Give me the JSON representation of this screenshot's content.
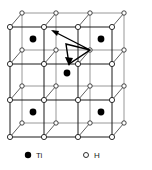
{
  "figure": {
    "name": "titanium-hydride-lattice",
    "projection": {
      "front_origin_x": 10,
      "front_origin_y": 27,
      "cell_size": 34,
      "depth_dx": 12,
      "depth_dy": -14,
      "columns": 4,
      "rows": 4
    },
    "colors": {
      "front_edge": "#1a1a1a",
      "back_edge": "#8c8c8c",
      "depth_edge": "#4d4d4d",
      "ti_fill": "#000000",
      "h_fill": "#ffffff",
      "h_stroke": "#1a1a1a",
      "arrow": "#000000",
      "background": "#ffffff"
    },
    "line_widths": {
      "front_edge": 1.0,
      "back_edge": 0.9,
      "depth_edge": 0.9,
      "arrow": 1.4
    },
    "atom_radii": {
      "h_front": 2.6,
      "h_back": 2.2,
      "ti": 3.4
    }
  },
  "lattice": {
    "h_front_nodes": [
      {
        "x": 10,
        "y": 27
      },
      {
        "x": 44,
        "y": 27
      },
      {
        "x": 78,
        "y": 27
      },
      {
        "x": 112,
        "y": 27
      },
      {
        "x": 10,
        "y": 64
      },
      {
        "x": 44,
        "y": 64
      },
      {
        "x": 78,
        "y": 64
      },
      {
        "x": 112,
        "y": 64
      },
      {
        "x": 10,
        "y": 100
      },
      {
        "x": 44,
        "y": 100
      },
      {
        "x": 78,
        "y": 100
      },
      {
        "x": 112,
        "y": 100
      },
      {
        "x": 10,
        "y": 137
      },
      {
        "x": 44,
        "y": 137
      },
      {
        "x": 78,
        "y": 137
      },
      {
        "x": 112,
        "y": 137
      }
    ],
    "h_back_nodes": [
      {
        "x": 22,
        "y": 13
      },
      {
        "x": 56,
        "y": 13
      },
      {
        "x": 90,
        "y": 13
      },
      {
        "x": 124,
        "y": 13
      },
      {
        "x": 22,
        "y": 50
      },
      {
        "x": 56,
        "y": 50
      },
      {
        "x": 90,
        "y": 50
      },
      {
        "x": 124,
        "y": 50
      },
      {
        "x": 22,
        "y": 86
      },
      {
        "x": 56,
        "y": 86
      },
      {
        "x": 90,
        "y": 86
      },
      {
        "x": 124,
        "y": 86
      },
      {
        "x": 22,
        "y": 123
      },
      {
        "x": 56,
        "y": 123
      },
      {
        "x": 90,
        "y": 123
      },
      {
        "x": 124,
        "y": 123
      }
    ],
    "ti_atoms": [
      {
        "x": 33,
        "y": 39,
        "label": "Ti"
      },
      {
        "x": 101,
        "y": 39,
        "label": "Ti"
      },
      {
        "x": 67,
        "y": 73,
        "label": "Ti"
      },
      {
        "x": 33,
        "y": 112,
        "label": "Ti"
      },
      {
        "x": 101,
        "y": 112,
        "label": "Ti"
      }
    ],
    "front_h_lines_horizontal": [
      {
        "x1": 10,
        "y1": 27,
        "x2": 112,
        "y2": 27
      },
      {
        "x1": 10,
        "y1": 64,
        "x2": 112,
        "y2": 64
      },
      {
        "x1": 10,
        "y1": 100,
        "x2": 112,
        "y2": 100
      },
      {
        "x1": 10,
        "y1": 137,
        "x2": 112,
        "y2": 137
      }
    ],
    "front_h_lines_vertical": [
      {
        "x1": 10,
        "y1": 27,
        "x2": 10,
        "y2": 137
      },
      {
        "x1": 44,
        "y1": 27,
        "x2": 44,
        "y2": 137
      },
      {
        "x1": 78,
        "y1": 27,
        "x2": 78,
        "y2": 137
      },
      {
        "x1": 112,
        "y1": 27,
        "x2": 112,
        "y2": 137
      }
    ],
    "back_h_lines_horizontal": [
      {
        "x1": 22,
        "y1": 13,
        "x2": 124,
        "y2": 13
      },
      {
        "x1": 22,
        "y1": 50,
        "x2": 124,
        "y2": 50
      },
      {
        "x1": 22,
        "y1": 86,
        "x2": 124,
        "y2": 86
      },
      {
        "x1": 22,
        "y1": 123,
        "x2": 124,
        "y2": 123
      }
    ],
    "back_h_lines_vertical": [
      {
        "x1": 22,
        "y1": 13,
        "x2": 22,
        "y2": 123
      },
      {
        "x1": 56,
        "y1": 13,
        "x2": 56,
        "y2": 123
      },
      {
        "x1": 90,
        "y1": 13,
        "x2": 90,
        "y2": 123
      },
      {
        "x1": 124,
        "y1": 13,
        "x2": 124,
        "y2": 123
      }
    ],
    "depth_lines": [
      {
        "x1": 10,
        "y1": 27,
        "x2": 22,
        "y2": 13
      },
      {
        "x1": 44,
        "y1": 27,
        "x2": 56,
        "y2": 13
      },
      {
        "x1": 78,
        "y1": 27,
        "x2": 90,
        "y2": 13
      },
      {
        "x1": 112,
        "y1": 27,
        "x2": 124,
        "y2": 13
      },
      {
        "x1": 10,
        "y1": 64,
        "x2": 22,
        "y2": 50
      },
      {
        "x1": 44,
        "y1": 64,
        "x2": 56,
        "y2": 50
      },
      {
        "x1": 78,
        "y1": 64,
        "x2": 90,
        "y2": 50
      },
      {
        "x1": 112,
        "y1": 64,
        "x2": 124,
        "y2": 50
      },
      {
        "x1": 10,
        "y1": 100,
        "x2": 22,
        "y2": 86
      },
      {
        "x1": 44,
        "y1": 100,
        "x2": 56,
        "y2": 86
      },
      {
        "x1": 78,
        "y1": 100,
        "x2": 90,
        "y2": 86
      },
      {
        "x1": 112,
        "y1": 100,
        "x2": 124,
        "y2": 86
      },
      {
        "x1": 10,
        "y1": 137,
        "x2": 22,
        "y2": 123
      },
      {
        "x1": 44,
        "y1": 137,
        "x2": 56,
        "y2": 123
      },
      {
        "x1": 78,
        "y1": 137,
        "x2": 90,
        "y2": 123
      },
      {
        "x1": 112,
        "y1": 137,
        "x2": 124,
        "y2": 123
      }
    ]
  },
  "annotation": {
    "name": "diffusion-path-arrow",
    "path_points": "53,31 90,50 69,64 66,44 90,50",
    "arrowheads": [
      {
        "x": 53,
        "y": 31,
        "angle": -153,
        "label": "arrowhead-upper-left"
      },
      {
        "x": 69,
        "y": 64,
        "angle": 120,
        "label": "arrowhead-lower"
      }
    ]
  },
  "legend": {
    "items": [
      {
        "marker": "filled-circle",
        "symbol": "●",
        "label": "Ti",
        "x": 28,
        "y": 158
      },
      {
        "marker": "open-circle",
        "symbol": "○",
        "label": "H",
        "x": 86,
        "y": 158
      }
    ]
  }
}
